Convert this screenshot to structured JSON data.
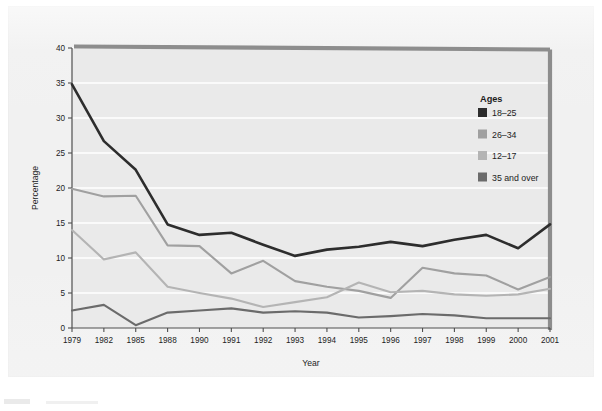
{
  "chart_data": {
    "type": "line",
    "title": "",
    "xlabel": "Year",
    "ylabel": "Percentage",
    "legend_title": "Ages",
    "legend_position": "inside-right-upper",
    "grid": true,
    "ylim": [
      0,
      40
    ],
    "yticks": [
      0,
      5,
      10,
      15,
      20,
      25,
      30,
      35,
      40
    ],
    "categories": [
      "1979",
      "1982",
      "1985",
      "1988",
      "1990",
      "1991",
      "1992",
      "1993",
      "1994",
      "1995",
      "1996",
      "1997",
      "1998",
      "1999",
      "2000",
      "2001"
    ],
    "series": [
      {
        "name": "18–25",
        "color": "#2d2d2d",
        "values": [
          34.8,
          26.7,
          22.6,
          14.8,
          13.3,
          13.6,
          11.9,
          10.3,
          11.2,
          11.6,
          12.3,
          11.7,
          12.6,
          13.3,
          11.4,
          14.8
        ]
      },
      {
        "name": "26–34",
        "color": "#a0a0a0",
        "values": [
          19.9,
          18.8,
          18.9,
          11.8,
          11.7,
          7.8,
          9.6,
          6.7,
          5.9,
          5.3,
          4.3,
          8.6,
          7.8,
          7.5,
          5.5,
          7.3
        ]
      },
      {
        "name": "12–17",
        "color": "#b4b4b4",
        "values": [
          14.0,
          9.8,
          10.8,
          5.9,
          5.0,
          4.2,
          3.0,
          3.7,
          4.4,
          6.5,
          5.1,
          5.3,
          4.8,
          4.6,
          4.8,
          5.6
        ]
      },
      {
        "name": "35 and over",
        "color": "#6b6b6b",
        "values": [
          2.5,
          3.3,
          0.4,
          2.2,
          2.5,
          2.8,
          2.2,
          2.4,
          2.2,
          1.5,
          1.7,
          2.0,
          1.8,
          1.4,
          1.4,
          1.4
        ]
      }
    ]
  },
  "legend": {
    "title": "Ages",
    "items": [
      {
        "label": "18–25",
        "color": "#2d2d2d"
      },
      {
        "label": "26–34",
        "color": "#a0a0a0"
      },
      {
        "label": "12–17",
        "color": "#b4b4b4"
      },
      {
        "label": "35 and over",
        "color": "#6b6b6b"
      }
    ]
  },
  "axes": {
    "x_title": "Year",
    "y_title": "Percentage",
    "y_ticks": [
      "0",
      "5",
      "10",
      "15",
      "20",
      "25",
      "30",
      "35",
      "40"
    ],
    "x_ticks": [
      "1979",
      "1982",
      "1985",
      "1988",
      "1990",
      "1991",
      "1992",
      "1993",
      "1994",
      "1995",
      "1996",
      "1997",
      "1998",
      "1999",
      "2000",
      "2001"
    ]
  },
  "style": {
    "page_background": "#ffffff",
    "panel_background": "#f1f1f1",
    "plot_background": "#eaeaea",
    "gridline_color": "#ffffff",
    "axis_color": "#4f4f4f",
    "scan_edge_color": "#8d8d8d"
  }
}
